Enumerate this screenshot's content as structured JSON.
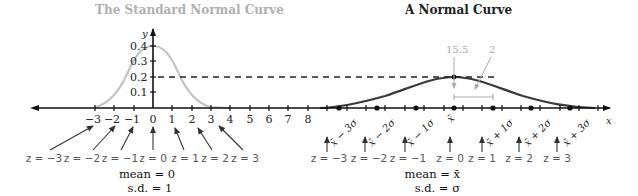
{
  "left_panel": {
    "title": "The Standard Normal Curve",
    "y_axis_label": "y",
    "y_ticks": [
      "0.4",
      "0.3",
      "0.2",
      "0.1"
    ],
    "x_ticks": [
      "−3",
      "−2",
      "−1",
      "0",
      "1",
      "2",
      "3",
      "4",
      "5",
      "6",
      "7",
      "8"
    ],
    "z_labels": [
      "z = −3",
      "z = −2",
      "z = −1",
      "z = 0",
      "z = 1",
      "z = 2",
      "z = 3"
    ],
    "mean_label": "mean = 0",
    "sd_label": "s.d. = 1",
    "curve_color": "#c0c0c0"
  },
  "right_panel": {
    "title": "A Normal Curve",
    "x_axis_label": "x",
    "mean_annotation": "15.5",
    "sd_annotation": "2",
    "sigma_labels": [
      "x̄ − 3σ",
      "x̄ − 2σ",
      "x̄ − 1σ",
      "x̄",
      "x̄ + 1σ",
      "x̄ + 2σ",
      "x̄ + 3σ"
    ],
    "z_labels": [
      "z = −3",
      "z = −2",
      "z = −1",
      "z = 0",
      "z = 1",
      "z = 2",
      "z = 3"
    ],
    "mean_label": "mean = x̄",
    "sd_label": "s.d. = σ",
    "curve_color": "#3a3a3a"
  },
  "colors": {
    "title_left": "#b0b0b0",
    "title_right": "#222222",
    "axis": "#111111",
    "annotation": "#aaaaaa"
  }
}
